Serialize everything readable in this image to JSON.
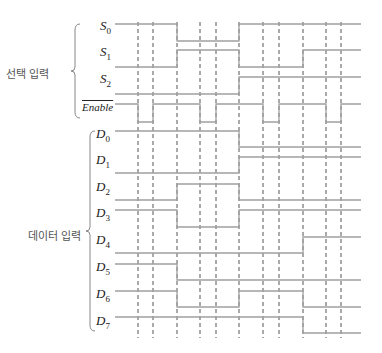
{
  "groups": {
    "select": {
      "label": "선택 입력"
    },
    "data": {
      "label": "데이터 입력"
    }
  },
  "timing": {
    "x_start": 115,
    "x_end": 361,
    "transitions": [
      115,
      177,
      239,
      303,
      361
    ],
    "dashed_lines_x": [
      138,
      153,
      177,
      200,
      216,
      239,
      263,
      279,
      303,
      326,
      341
    ],
    "colors": {
      "signal": "#a0a0a0",
      "dashed": "#555555",
      "brace": "#888888"
    }
  },
  "signals": [
    {
      "id": "S0",
      "base": "S",
      "sub": "0",
      "overline": false,
      "high_y": 24,
      "low_y": 41,
      "values": [
        1,
        0,
        1,
        1
      ]
    },
    {
      "id": "S1",
      "base": "S",
      "sub": "1",
      "overline": false,
      "high_y": 50,
      "low_y": 67,
      "values": [
        0,
        1,
        0,
        1
      ]
    },
    {
      "id": "S2",
      "base": "S",
      "sub": "2",
      "overline": false,
      "high_y": 77,
      "low_y": 94,
      "values": [
        0,
        0,
        1,
        1
      ]
    },
    {
      "id": "Enable",
      "base": "Enable",
      "sub": "",
      "overline": true,
      "high_y": 104,
      "low_y": 122,
      "pulses_low": [
        [
          138,
          153
        ],
        [
          200,
          216
        ],
        [
          263,
          279
        ],
        [
          326,
          341
        ]
      ]
    },
    {
      "id": "D0",
      "base": "D",
      "sub": "0",
      "overline": false,
      "high_y": 131,
      "low_y": 147,
      "values": [
        1,
        1,
        0,
        0
      ]
    },
    {
      "id": "D1",
      "base": "D",
      "sub": "1",
      "overline": false,
      "high_y": 157,
      "low_y": 173,
      "values": [
        0,
        0,
        1,
        1
      ]
    },
    {
      "id": "D2",
      "base": "D",
      "sub": "2",
      "overline": false,
      "high_y": 184,
      "low_y": 200,
      "values": [
        0,
        1,
        0,
        0
      ]
    },
    {
      "id": "D3",
      "base": "D",
      "sub": "3",
      "overline": false,
      "high_y": 210,
      "low_y": 227,
      "values": [
        1,
        0,
        1,
        1
      ]
    },
    {
      "id": "D4",
      "base": "D",
      "sub": "4",
      "overline": false,
      "high_y": 237,
      "low_y": 253,
      "values": [
        0,
        0,
        0,
        1
      ]
    },
    {
      "id": "D5",
      "base": "D",
      "sub": "5",
      "overline": false,
      "high_y": 264,
      "low_y": 280,
      "values": [
        1,
        0,
        0,
        0
      ]
    },
    {
      "id": "D6",
      "base": "D",
      "sub": "6",
      "overline": false,
      "high_y": 291,
      "low_y": 307,
      "values": [
        1,
        0,
        1,
        0
      ]
    },
    {
      "id": "D7",
      "base": "D",
      "sub": "7",
      "overline": false,
      "high_y": 317,
      "low_y": 333,
      "values": [
        1,
        1,
        1,
        0
      ]
    }
  ],
  "labels": {
    "S0": {
      "text": "S",
      "sub": "0",
      "x": 83,
      "y": 20
    },
    "S1": {
      "text": "S",
      "sub": "1",
      "x": 83,
      "y": 46
    },
    "S2": {
      "text": "S",
      "sub": "2",
      "x": 83,
      "y": 73
    },
    "Enable": {
      "text": "Enable",
      "x": 82,
      "y": 100
    },
    "D0": {
      "text": "D",
      "sub": "0",
      "x": 96,
      "y": 128
    },
    "D1": {
      "text": "D",
      "sub": "1",
      "x": 96,
      "y": 154
    },
    "D2": {
      "text": "D",
      "sub": "2",
      "x": 96,
      "y": 181
    },
    "D3": {
      "text": "D",
      "sub": "3",
      "x": 96,
      "y": 207
    },
    "D4": {
      "text": "D",
      "sub": "4",
      "x": 96,
      "y": 234
    },
    "D5": {
      "text": "D",
      "sub": "5",
      "x": 96,
      "y": 261
    },
    "D6": {
      "text": "D",
      "sub": "6",
      "x": 96,
      "y": 288
    },
    "D7": {
      "text": "D",
      "sub": "7",
      "x": 96,
      "y": 315
    }
  }
}
